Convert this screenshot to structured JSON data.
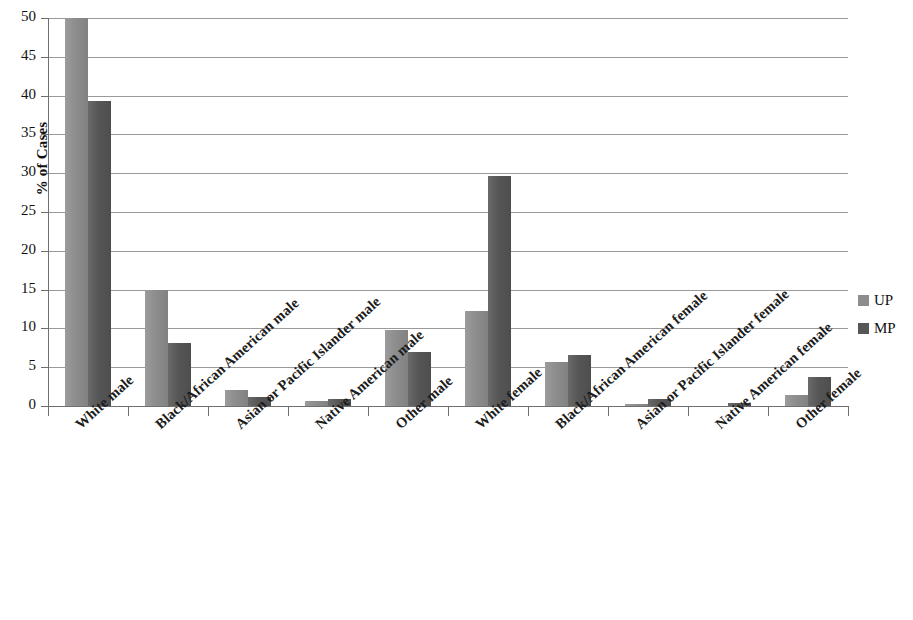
{
  "chart_data": {
    "type": "bar",
    "title": "",
    "xlabel": "",
    "ylabel": "% of Cases",
    "ylim": [
      0,
      50
    ],
    "yticks": [
      0,
      5,
      10,
      15,
      20,
      25,
      30,
      35,
      40,
      45,
      50
    ],
    "grid": true,
    "legend_position": "right",
    "categories": [
      "White male",
      "Black/African American male",
      "Asian or Pacific Islander male",
      "Native American male",
      "Other male",
      "White female",
      "Black/African American female",
      "Asian or Pacific Islander female",
      "Native American female",
      "Other female"
    ],
    "series": [
      {
        "name": "UP",
        "color": "#8d8d8d",
        "values": [
          50.0,
          15.0,
          2.0,
          0.6,
          9.8,
          12.2,
          5.7,
          0.3,
          0.0,
          1.4
        ]
      },
      {
        "name": "MP",
        "color": "#565656",
        "values": [
          39.3,
          8.1,
          1.1,
          0.9,
          7.0,
          29.7,
          6.6,
          0.9,
          0.4,
          3.7
        ]
      }
    ]
  },
  "axis": {
    "y_title": "% of Cases",
    "y_tick_labels": [
      "50",
      "45",
      "40",
      "35",
      "30",
      "25",
      "20",
      "15",
      "10",
      "5",
      "0"
    ]
  },
  "legend": {
    "items": [
      {
        "label": "UP",
        "color": "#8d8d8d"
      },
      {
        "label": "MP",
        "color": "#565656"
      }
    ]
  }
}
